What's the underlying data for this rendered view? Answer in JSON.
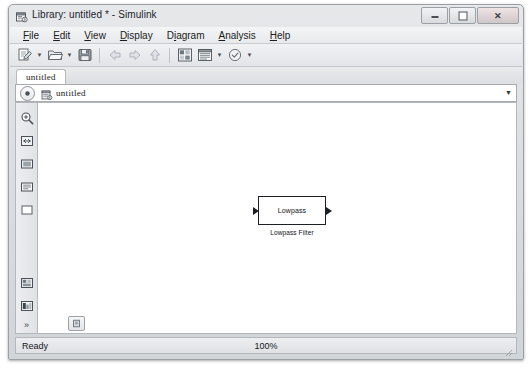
{
  "window": {
    "title": "Library: untitled * - Simulink",
    "title_icon": "simulink-library-icon",
    "controls": {
      "minimize": "minimize-button",
      "maximize": "maximize-button",
      "close": "close-button"
    }
  },
  "menubar": {
    "items": [
      {
        "label": "File",
        "mnemonic": "F"
      },
      {
        "label": "Edit",
        "mnemonic": "E"
      },
      {
        "label": "View",
        "mnemonic": "V"
      },
      {
        "label": "Display",
        "mnemonic": "D"
      },
      {
        "label": "Diagram",
        "mnemonic": "i"
      },
      {
        "label": "Analysis",
        "mnemonic": "A"
      },
      {
        "label": "Help",
        "mnemonic": "H"
      }
    ]
  },
  "toolbar": {
    "items": [
      {
        "name": "new-model-icon",
        "tooltip": "New"
      },
      {
        "name": "new-model-dropdown",
        "tooltip": "New menu"
      },
      {
        "name": "open-folder-icon",
        "tooltip": "Open"
      },
      {
        "name": "open-dropdown",
        "tooltip": "Open menu"
      },
      {
        "name": "save-icon",
        "tooltip": "Save"
      },
      {
        "name": "back-arrow-icon",
        "tooltip": "Back"
      },
      {
        "name": "forward-arrow-icon",
        "tooltip": "Forward"
      },
      {
        "name": "up-arrow-icon",
        "tooltip": "Up to Parent"
      },
      {
        "name": "library-browser-icon",
        "tooltip": "Library Browser"
      },
      {
        "name": "model-explorer-icon",
        "tooltip": "Model Explorer"
      },
      {
        "name": "model-explorer-dropdown",
        "tooltip": "Model Explorer menu"
      },
      {
        "name": "update-diagram-icon",
        "tooltip": "Update Diagram"
      },
      {
        "name": "update-diagram-dropdown",
        "tooltip": "Update menu"
      }
    ]
  },
  "tabs": [
    {
      "label": "untitled",
      "active": true
    }
  ],
  "breadcrumb": {
    "back_icon": "back-circle-icon",
    "library_icon": "library-icon",
    "path": "untitled",
    "dropdown_icon": "chevron-down-icon"
  },
  "sidebar": {
    "items": [
      {
        "name": "zoom-in-icon"
      },
      {
        "name": "fit-to-view-icon"
      },
      {
        "name": "zoom-normal-icon"
      },
      {
        "name": "annotation-icon"
      },
      {
        "name": "rectangle-icon"
      }
    ],
    "bottom_items": [
      {
        "name": "model-settings-icon"
      },
      {
        "name": "block-parameters-icon"
      }
    ],
    "overflow_label": "»"
  },
  "canvas": {
    "background_color": "#ffffff",
    "blocks": [
      {
        "name": "lowpass-filter-block",
        "label": "Lowpass",
        "caption": "Lowpass Filter",
        "input_ports": 1,
        "output_ports": 1
      }
    ],
    "bottom_button": "properties-icon"
  },
  "statusbar": {
    "message": "Ready",
    "zoom": "100%",
    "grip": "resize-grip"
  },
  "colors": {
    "frame": "#d2d5d8",
    "border": "#9aa0a6",
    "canvas": "#ffffff",
    "text": "#15181c",
    "block_stroke": "#1c1f23"
  }
}
